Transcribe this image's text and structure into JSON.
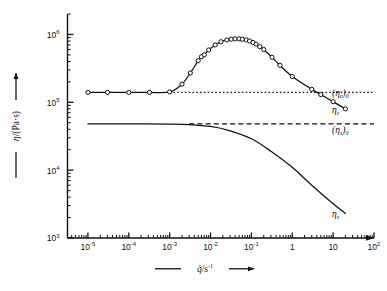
{
  "chart_data": {
    "type": "line",
    "title": "",
    "xlabel": "q̇/s⁻¹",
    "ylabel": "η/(Pa·s)",
    "xscale": "log",
    "yscale": "log",
    "xlim": [
      3.16e-06,
      100.0
    ],
    "ylim": [
      1000,
      2000000
    ],
    "grid": false,
    "legend": null,
    "xticks": [
      {
        "value": 1e-05,
        "label": "10",
        "exp": "-5"
      },
      {
        "value": 0.0001,
        "label": "10",
        "exp": "-4"
      },
      {
        "value": 0.001,
        "label": "10",
        "exp": "-3"
      },
      {
        "value": 0.01,
        "label": "10",
        "exp": "-2"
      },
      {
        "value": 0.1,
        "label": "10",
        "exp": "-1"
      },
      {
        "value": 1,
        "label": "1",
        "exp": ""
      },
      {
        "value": 10,
        "label": "10",
        "exp": ""
      },
      {
        "value": 100,
        "label": "10",
        "exp": "2"
      }
    ],
    "yticks": [
      {
        "value": 1000000,
        "label": "10",
        "exp": "6"
      },
      {
        "value": 100000,
        "label": "10",
        "exp": "5"
      },
      {
        "value": 10000,
        "label": "10",
        "exp": "4"
      },
      {
        "value": 1000,
        "label": "10",
        "exp": "3"
      }
    ],
    "series": [
      {
        "name": "η_e",
        "style": "solid-with-open-circle-markers",
        "markers": true,
        "points": [
          [
            1e-05,
            140000.0
          ],
          [
            3e-05,
            140000.0
          ],
          [
            0.0001,
            140000.0
          ],
          [
            0.00032,
            140000.0
          ],
          [
            0.001,
            142000.0
          ],
          [
            0.002,
            185000.0
          ],
          [
            0.0032,
            270000.0
          ],
          [
            0.005,
            410000.0
          ],
          [
            0.006,
            470000.0
          ],
          [
            0.007,
            500000.0
          ],
          [
            0.009,
            590000.0
          ],
          [
            0.013,
            700000.0
          ],
          [
            0.018,
            780000.0
          ],
          [
            0.025,
            830000.0
          ],
          [
            0.032,
            850000.0
          ],
          [
            0.04,
            860000.0
          ],
          [
            0.05,
            860000.0
          ],
          [
            0.06,
            850000.0
          ],
          [
            0.075,
            830000.0
          ],
          [
            0.09,
            800000.0
          ],
          [
            0.11,
            760000.0
          ],
          [
            0.13,
            720000.0
          ],
          [
            0.16,
            660000.0
          ],
          [
            0.2,
            600000.0
          ],
          [
            0.32,
            460000.0
          ],
          [
            0.5,
            350000.0
          ],
          [
            1.0,
            240000.0
          ],
          [
            3.0,
            155000.0
          ],
          [
            5.0,
            130000.0
          ],
          [
            10.0,
            102000.0
          ],
          [
            20.0,
            80000.0
          ]
        ]
      },
      {
        "name": "η_s",
        "style": "solid",
        "markers": false,
        "points": [
          [
            1e-05,
            48000.0
          ],
          [
            0.0001,
            48000.0
          ],
          [
            0.001,
            47800.0
          ],
          [
            0.003,
            47000.0
          ],
          [
            0.01,
            44000.0
          ],
          [
            0.03,
            38000.0
          ],
          [
            0.1,
            29000.0
          ],
          [
            0.3,
            19000.0
          ],
          [
            1.0,
            11000.0
          ],
          [
            3.0,
            6000.0
          ],
          [
            10.0,
            3200.0
          ],
          [
            20.0,
            2300.0
          ]
        ]
      }
    ],
    "reference_lines": [
      {
        "name": "(η_e)_0",
        "value": 140000.0,
        "style": "dotted",
        "x_from": 0.001,
        "x_to": 100.0
      },
      {
        "name": "(η_s)_0",
        "value": 48000.0,
        "style": "dashed",
        "x_from": 0.003,
        "x_to": 100.0
      }
    ],
    "annotations": [
      {
        "id": "eta-e-zero",
        "text_base": "(η",
        "text_sub1": "e",
        "text_mid": ")",
        "text_sub2": "0",
        "x": 100,
        "y": 140000.0
      },
      {
        "id": "eta-e",
        "text_base": "η",
        "text_sub1": "e",
        "text_mid": "",
        "text_sub2": "",
        "x": 100,
        "y": 80000.0
      },
      {
        "id": "eta-s-zero",
        "text_base": "(η",
        "text_sub1": "s",
        "text_mid": ")",
        "text_sub2": "0",
        "x": 100,
        "y": 40000.0
      },
      {
        "id": "eta-s",
        "text_base": "η",
        "text_sub1": "s",
        "text_mid": "",
        "text_sub2": "",
        "x": 100,
        "y": 2300.0
      }
    ]
  },
  "labels": {
    "y_axis_main": "η/(Pa·s)",
    "x_axis_main": "q̇/s",
    "x_axis_exp": "-1",
    "eta_e_zero_open": "(η",
    "eta_e_zero_sub_e": "e",
    "eta_e_zero_close": ")",
    "eta_e_zero_sub_0": "0",
    "eta_e_base": "η",
    "eta_e_sub": "e",
    "eta_s_zero_open": "(η",
    "eta_s_zero_sub_s": "s",
    "eta_s_zero_close": ")",
    "eta_s_zero_sub_0": "0",
    "eta_s_base": "η",
    "eta_s_sub": "s"
  },
  "colors": {
    "ink": "#111111",
    "background": "#ffffff"
  }
}
